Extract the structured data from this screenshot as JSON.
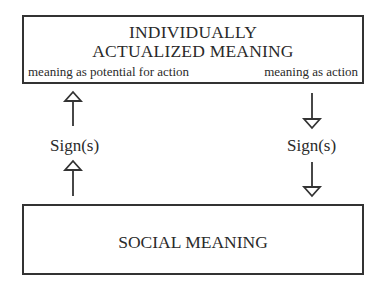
{
  "diagram": {
    "top_box": {
      "title_line1": "INDIVIDUALLY",
      "title_line2": "ACTUALIZED MEANING",
      "left_caption": "meaning as potential for action",
      "right_caption": "meaning as action"
    },
    "bottom_box": {
      "label": "SOCIAL MEANING"
    },
    "left_connector": {
      "label": "Sign(s)",
      "direction": "up",
      "arrow_icons": [
        "arrow-up-icon",
        "arrow-up-icon"
      ]
    },
    "right_connector": {
      "label": "Sign(s)",
      "direction": "down",
      "arrow_icons": [
        "arrow-down-icon",
        "arrow-down-icon"
      ]
    },
    "colors": {
      "stroke": "#333333",
      "text": "#2a2a2a",
      "background": "#ffffff"
    }
  }
}
